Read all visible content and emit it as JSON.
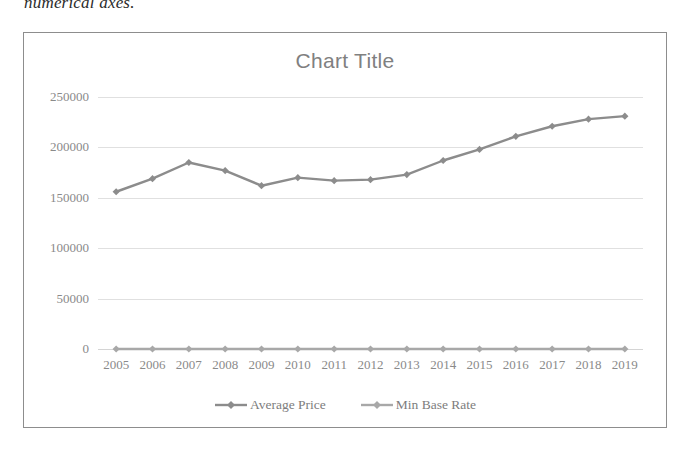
{
  "page": {
    "caption_text": "numerical axes."
  },
  "chart": {
    "title": "Chart Title",
    "legend": [
      {
        "name": "Average Price",
        "color": "#8c8c8c",
        "marker": "diamond-marker"
      },
      {
        "name": "Min Base Rate",
        "color": "#a8a8a8",
        "marker": "diamond-marker"
      }
    ]
  },
  "chart_data": {
    "type": "line",
    "title": "Chart Title",
    "xlabel": "",
    "ylabel": "",
    "categories": [
      "2005",
      "2006",
      "2007",
      "2008",
      "2009",
      "2010",
      "2011",
      "2012",
      "2013",
      "2014",
      "2015",
      "2016",
      "2017",
      "2018",
      "2019"
    ],
    "yticks": [
      0,
      50000,
      100000,
      150000,
      200000,
      250000
    ],
    "ytick_labels": [
      "0",
      "50000",
      "100000",
      "150000",
      "200000",
      "250000"
    ],
    "ylim": [
      0,
      250000
    ],
    "grid": true,
    "legend_position": "bottom",
    "series": [
      {
        "name": "Average Price",
        "color": "#8c8c8c",
        "marker": "diamond-marker",
        "values": [
          156000,
          169000,
          185000,
          177000,
          162000,
          170000,
          167000,
          168000,
          173000,
          187000,
          198000,
          211000,
          221000,
          228000,
          231000
        ]
      },
      {
        "name": "Min Base Rate",
        "color": "#a8a8a8",
        "marker": "diamond-marker",
        "values": [
          0,
          0,
          0,
          0,
          0,
          0,
          0,
          0,
          0,
          0,
          0,
          0,
          0,
          0,
          0
        ]
      }
    ]
  }
}
